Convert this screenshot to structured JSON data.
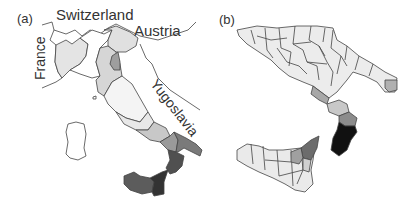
{
  "figure": {
    "panels": [
      {
        "id": "a",
        "label": "(a)",
        "title": "Italy regions shaded",
        "country_labels": {
          "switzerland": "Switzerland",
          "austria": "Austria",
          "france": "France",
          "yugoslavia": "Yugoslavia"
        },
        "shading": {
          "lightest": "#ffffff",
          "light": "#e6e6e6",
          "medium_light": "#cfcfcf",
          "medium": "#a9a9a9",
          "medium_dark": "#7a7a7a",
          "dark": "#4f4f4f",
          "darkest": "#2e2e2e"
        }
      },
      {
        "id": "b",
        "label": "(b)",
        "title": "Southern Italy and Sicily districts shaded",
        "shading": {
          "light": "#ececec",
          "medium_light": "#d4d4d4",
          "medium": "#a0a0a0",
          "dark": "#5a5a5a",
          "darkest": "#111111"
        }
      }
    ]
  }
}
